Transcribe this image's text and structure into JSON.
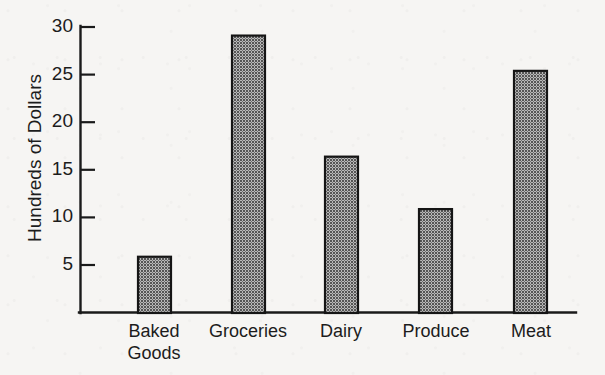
{
  "chart_data": {
    "type": "bar",
    "title": "",
    "subtitle": "",
    "xlabel": "",
    "ylabel": "Hundreds of Dollars",
    "categories": [
      "Baked Goods",
      "Groceries",
      "Dairy",
      "Produce",
      "Meat"
    ],
    "values": [
      5.9,
      29.1,
      16.4,
      10.9,
      25.4
    ],
    "ylim": [
      0,
      30
    ],
    "yticks": [
      5,
      10,
      15,
      20,
      25,
      30
    ],
    "ytick_labels": [
      "5",
      "10",
      "15",
      "20",
      "25",
      "30"
    ],
    "grid": false,
    "legend": null,
    "annotations": [],
    "series": [
      {
        "name": "Spending",
        "values": [
          5.9,
          29.1,
          16.4,
          10.9,
          25.4
        ]
      }
    ]
  },
  "axis": {
    "y_title": "Hundreds of Dollars",
    "tick_labels": {
      "t5": "5",
      "t10": "10",
      "t15": "15",
      "t20": "20",
      "t25": "25",
      "t30": "30"
    }
  },
  "categories": {
    "c0_line1": "Baked",
    "c0_line2": "Goods",
    "c1": "Groceries",
    "c2": "Dairy",
    "c3": "Produce",
    "c4": "Meat"
  },
  "colors": {
    "background": "#f6f5f3",
    "ink": "#1a1a1a",
    "bar_fill": "#808080",
    "bar_stroke": "#151515"
  }
}
